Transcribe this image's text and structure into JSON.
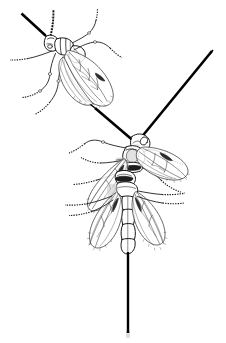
{
  "figure": {
    "background_color": "#ffffff",
    "ink_color": "#1a1a1a",
    "width_px": 226,
    "height_px": 343,
    "has_caption_text": false,
    "has_scale_bar": false
  },
  "specimens": [
    {
      "id": "specimen-upper-left",
      "label": "upper left wasp",
      "orientation": "head toward upper left, body angled down-right",
      "parts": [
        "head",
        "compound-eye",
        "thick-antenna",
        "beaded-antenna",
        "pronotum",
        "mesosoma",
        "forewing",
        "hindwing",
        "fore-leg",
        "mid-leg",
        "hind-leg",
        "tarsus"
      ]
    },
    {
      "id": "specimen-middle",
      "label": "middle wasp",
      "orientation": "head toward upper right, body angled down-left",
      "parts": [
        "head",
        "compound-eye",
        "thick-antenna-left",
        "thick-antenna-right",
        "mesosoma",
        "scutellum",
        "forewing-left",
        "forewing-right",
        "legs",
        "tarsus"
      ]
    },
    {
      "id": "specimen-lower",
      "label": "lower wasp",
      "orientation": "head up, abdomen down, wings spread laterally",
      "parts": [
        "head",
        "mesosoma",
        "petiole",
        "metasoma",
        "forewing-left",
        "forewing-right",
        "hind-leg-left",
        "hind-leg-right",
        "ovipositor"
      ]
    }
  ],
  "annotations": {
    "ovipositor": {
      "name": "ovipositor",
      "orientation": "vertical, extending below abdomen",
      "color": "#000000"
    },
    "antenna_upper_left": {
      "name": "antenna",
      "orientation": "diagonal toward upper left corner",
      "color": "#000000"
    },
    "antenna_upper_right": {
      "name": "antenna",
      "orientation": "diagonal toward upper right corner",
      "color": "#000000"
    }
  }
}
